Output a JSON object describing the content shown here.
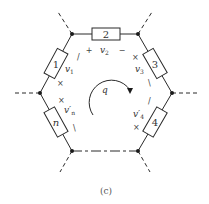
{
  "figure": {
    "caption": "(c)",
    "loop": {
      "label": "q",
      "direction": "clockwise"
    },
    "branches": [
      {
        "id": "1",
        "voltage": "v",
        "voltage_sub": "1",
        "plus": "×",
        "minus": "/"
      },
      {
        "id": "2",
        "voltage": "v",
        "voltage_sub": "2",
        "plus": "+",
        "minus": "−"
      },
      {
        "id": "3",
        "voltage": "v",
        "voltage_sub": "3",
        "plus": "×",
        "minus": "\\"
      },
      {
        "id": "4",
        "voltage": "v′",
        "voltage_sub": "4",
        "plus": "×",
        "minus": "/"
      },
      {
        "id": "n",
        "voltage": "v′",
        "voltage_sub": "n",
        "plus": "×",
        "minus": "\\"
      }
    ],
    "colors": {
      "line": "#2a2a2a",
      "node": "#1a1a1a",
      "background": "#ffffff"
    }
  }
}
